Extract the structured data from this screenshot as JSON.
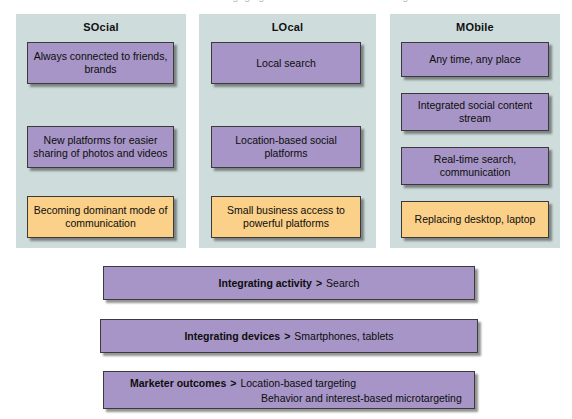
{
  "figure": {
    "top_artifact_text": "recommendations for engaging in social and mobile marketing"
  },
  "colors": {
    "panel_background": "#cfdcdc",
    "box_purple": "#a695c6",
    "box_orange": "#fbd089",
    "box_border": "#3a3a3a",
    "page_background": "#ffffff"
  },
  "columns": [
    {
      "title": "SOcial",
      "boxes": [
        {
          "text": "Always connected to friends, brands",
          "color": "purple"
        },
        {
          "text": "New platforms for easier sharing of photos and videos",
          "color": "purple"
        },
        {
          "text": "Becoming dominant mode of communication",
          "color": "orange"
        }
      ]
    },
    {
      "title": "LOcal",
      "boxes": [
        {
          "text": "Local search",
          "color": "purple"
        },
        {
          "text": "Location-based social platforms",
          "color": "purple"
        },
        {
          "text": "Small business access to powerful platforms",
          "color": "orange"
        }
      ]
    },
    {
      "title": "MObile",
      "boxes": [
        {
          "text": "Any time, any place",
          "color": "purple"
        },
        {
          "text": "Integrated social content stream",
          "color": "purple"
        },
        {
          "text": "Real-time search, communication",
          "color": "purple"
        },
        {
          "text": "Replacing desktop, laptop",
          "color": "orange"
        }
      ]
    }
  ],
  "bars": [
    {
      "label": "Integrating activity",
      "arrow": ">",
      "value": "Search",
      "value2": ""
    },
    {
      "label": "Integrating devices",
      "arrow": ">",
      "value": "Smartphones, tablets",
      "value2": ""
    },
    {
      "label": "Marketer outcomes",
      "arrow": ">",
      "value": "Location-based targeting",
      "value2": "Behavior and interest-based microtargeting"
    }
  ]
}
